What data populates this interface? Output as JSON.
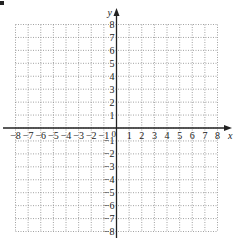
{
  "chart_data": {
    "type": "scatter",
    "title": "",
    "xlabel": "x",
    "ylabel": "y",
    "xlim": [
      -8,
      8
    ],
    "ylim": [
      -8,
      8
    ],
    "grid": true,
    "grid_style": "dotted",
    "x_ticks": [
      -8,
      -7,
      -6,
      -5,
      -4,
      -3,
      -2,
      -1,
      1,
      2,
      3,
      4,
      5,
      6,
      7,
      8
    ],
    "y_ticks": [
      -8,
      -7,
      -6,
      -5,
      -4,
      -3,
      -2,
      -1,
      1,
      2,
      3,
      4,
      5,
      6,
      7,
      8
    ],
    "x_tick_labels": [
      "−8",
      "−7",
      "−6",
      "−5",
      "−4",
      "−3",
      "−2",
      "−1",
      "1",
      "2",
      "3",
      "4",
      "5",
      "6",
      "7",
      "8"
    ],
    "y_tick_labels": [
      "−8",
      "−7",
      "−6",
      "−5",
      "−4",
      "−3",
      "−2",
      "−1",
      "1",
      "2",
      "3",
      "4",
      "5",
      "6",
      "7",
      "8"
    ],
    "origin_label": "0",
    "series": [],
    "legend": null
  },
  "colors": {
    "axis": "#222222",
    "grid": "#8a8a8a",
    "background": "#ffffff"
  }
}
